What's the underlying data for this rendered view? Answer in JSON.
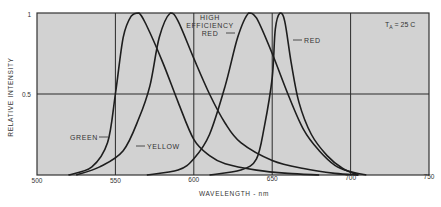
{
  "chart_data": {
    "type": "line",
    "title": "",
    "xlabel": "WAVELENGTH - nm",
    "ylabel": "RELATIVE INTENSITY",
    "xlim": [
      500,
      750
    ],
    "ylim": [
      0,
      1
    ],
    "x_ticks": [
      500,
      550,
      600,
      650,
      700,
      750
    ],
    "y_ticks": [
      {
        "value": 0.5,
        "label": "0.5"
      },
      {
        "value": 1,
        "label": "1"
      }
    ],
    "grid": true,
    "annotation": {
      "text_main": "T",
      "text_sub": "A",
      "text_rest": " = 25 C"
    },
    "series": [
      {
        "name": "GREEN",
        "peak_nm": 565,
        "points": [
          [
            520,
            0
          ],
          [
            535,
            0.05
          ],
          [
            545,
            0.2
          ],
          [
            550,
            0.5
          ],
          [
            555,
            0.85
          ],
          [
            560,
            0.98
          ],
          [
            565,
            1
          ],
          [
            570,
            0.92
          ],
          [
            580,
            0.7
          ],
          [
            590,
            0.45
          ],
          [
            600,
            0.22
          ],
          [
            610,
            0.12
          ],
          [
            620,
            0.07
          ],
          [
            640,
            0.03
          ],
          [
            660,
            0.01
          ],
          [
            680,
            0
          ]
        ]
      },
      {
        "name": "YELLOW",
        "peak_nm": 585,
        "points": [
          [
            525,
            0
          ],
          [
            540,
            0.05
          ],
          [
            555,
            0.15
          ],
          [
            565,
            0.35
          ],
          [
            572,
            0.55
          ],
          [
            578,
            0.85
          ],
          [
            585,
            1
          ],
          [
            590,
            0.95
          ],
          [
            600,
            0.72
          ],
          [
            610,
            0.5
          ],
          [
            620,
            0.32
          ],
          [
            630,
            0.2
          ],
          [
            650,
            0.09
          ],
          [
            670,
            0.04
          ],
          [
            690,
            0.01
          ],
          [
            705,
            0
          ]
        ]
      },
      {
        "name": "HIGH EFFICIENCY RED",
        "peak_nm": 635,
        "points": [
          [
            570,
            0
          ],
          [
            590,
            0.03
          ],
          [
            600,
            0.1
          ],
          [
            610,
            0.25
          ],
          [
            620,
            0.55
          ],
          [
            628,
            0.85
          ],
          [
            635,
            1
          ],
          [
            640,
            0.97
          ],
          [
            650,
            0.75
          ],
          [
            660,
            0.5
          ],
          [
            670,
            0.28
          ],
          [
            680,
            0.15
          ],
          [
            690,
            0.06
          ],
          [
            700,
            0.02
          ],
          [
            710,
            0
          ]
        ]
      },
      {
        "name": "RED",
        "peak_nm": 655,
        "points": [
          [
            610,
            0
          ],
          [
            630,
            0.03
          ],
          [
            640,
            0.1
          ],
          [
            645,
            0.3
          ],
          [
            650,
            0.6
          ],
          [
            652,
            0.9
          ],
          [
            655,
            1
          ],
          [
            658,
            0.95
          ],
          [
            662,
            0.7
          ],
          [
            667,
            0.45
          ],
          [
            675,
            0.25
          ],
          [
            685,
            0.12
          ],
          [
            695,
            0.04
          ],
          [
            705,
            0
          ]
        ]
      }
    ]
  },
  "labels": {
    "green": "GREEN",
    "yellow": "YELLOW",
    "her_line1": "HIGH",
    "her_line2": "EFFICIENCY",
    "her_line3": "RED",
    "red": "RED",
    "temp_T": "T",
    "temp_sub": "A",
    "temp_rest": " = 25 C",
    "xlabel": "WAVELENGTH - nm",
    "ylabel": "RELATIVE INTENSITY",
    "y_tick_1": "1",
    "y_tick_05": "0.5",
    "x_tick_500": "500",
    "x_tick_550": "550",
    "x_tick_600": "600",
    "x_tick_650": "650",
    "x_tick_700": "700",
    "x_tick_750": "750"
  },
  "colors": {
    "plot_bg": "#d2d2d2",
    "line": "#1e1e1e",
    "grid": "#2a2a2a",
    "text": "#333333"
  }
}
